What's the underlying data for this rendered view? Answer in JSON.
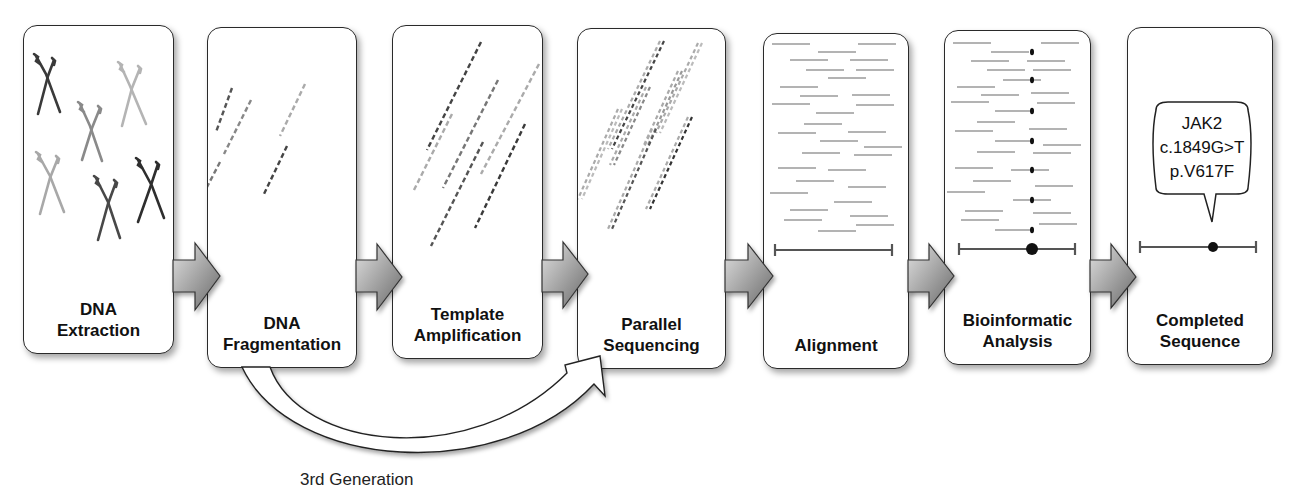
{
  "diagram": {
    "type": "workflow",
    "title": "",
    "steps": [
      {
        "id": "dna-extraction",
        "line1": "DNA",
        "line2": "Extraction",
        "icon": "chromosomes-icon"
      },
      {
        "id": "dna-fragmentation",
        "line1": "DNA",
        "line2": "Fragmentation",
        "icon": "dna-fragments-icon"
      },
      {
        "id": "template-amplification",
        "line1": "Template",
        "line2": "Amplification",
        "icon": "amplified-fragments-icon"
      },
      {
        "id": "parallel-sequencing",
        "line1": "Parallel",
        "line2": "Sequencing",
        "icon": "sequencing-reads-icon"
      },
      {
        "id": "alignment",
        "line1": "Alignment",
        "line2": "",
        "icon": "aligned-reads-icon"
      },
      {
        "id": "bioinformatic-analysis",
        "line1": "Bioinformatic",
        "line2": "Analysis",
        "icon": "variant-calling-icon"
      },
      {
        "id": "completed-sequence",
        "line1": "Completed",
        "line2": "Sequence",
        "icon": "reference-variant-icon"
      }
    ],
    "variant_callout": {
      "gene": "JAK2",
      "cdna": "c.1849G>T",
      "protein": "p.V617F"
    },
    "bypass": {
      "from": "dna-fragmentation",
      "to": "parallel-sequencing",
      "label": "3rd Generation"
    },
    "colors": {
      "panel_border": "#2a2a2a",
      "dark_strand": "#3a3a3a",
      "mid_strand": "#777777",
      "light_strand": "#aaaaaa",
      "arrow_light": "#d8d8d8",
      "arrow_dark": "#7a7a7a"
    }
  }
}
